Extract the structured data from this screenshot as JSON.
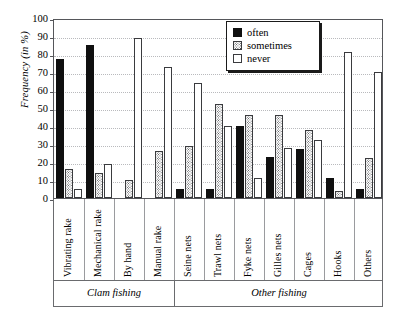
{
  "chart_data": {
    "type": "bar",
    "title": "",
    "subtitle": "",
    "xlabel": "",
    "ylabel": "Frequency (in %)",
    "ylim": [
      0,
      100
    ],
    "ytick_step": 10,
    "yticks": [
      "100",
      "90",
      "80",
      "70",
      "60",
      "50",
      "40",
      "30",
      "20",
      "10",
      "0"
    ],
    "grid": true,
    "legend_position": "top-right",
    "categories": [
      "Vibrating rake",
      "Mechanical rake",
      "By hand",
      "Manual rake",
      "Seine nets",
      "Trawl nets",
      "Fyke nets",
      "Gilles nets",
      "Cages",
      "Hooks",
      "Others"
    ],
    "series": [
      {
        "name": "often",
        "color": "#101010",
        "values": [
          77,
          85,
          0,
          0,
          5,
          5,
          40,
          23,
          27,
          11,
          5
        ]
      },
      {
        "name": "sometimes",
        "color": "#ffffff",
        "values": [
          16,
          14,
          10,
          26,
          29,
          52,
          46,
          46,
          38,
          4,
          22
        ]
      },
      {
        "name": "never",
        "color": "#ffffff",
        "values": [
          5,
          19,
          89,
          73,
          64,
          40,
          11,
          28,
          32,
          81,
          70
        ]
      }
    ],
    "category_groups": [
      {
        "label": "Clam fishing",
        "categories": [
          "Vibrating rake",
          "Mechanical rake",
          "By hand",
          "Manual rake"
        ]
      },
      {
        "label": "Other fishing",
        "categories": [
          "Seine nets",
          "Trawl nets",
          "Fyke nets",
          "Gilles nets",
          "Cages",
          "Hooks",
          "Others"
        ]
      }
    ]
  },
  "legend": {
    "entries": [
      {
        "label": "often"
      },
      {
        "label": "sometimes"
      },
      {
        "label": "never"
      }
    ]
  },
  "axis": {
    "y_title": "Frequency (in %)"
  }
}
